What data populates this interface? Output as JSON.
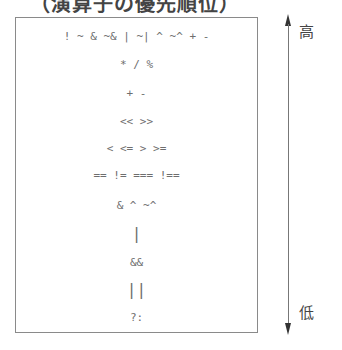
{
  "title": "（演算子の優先順位）",
  "precedence_rows": [
    "! ~ & ~& | ~| ^ ~^ + -",
    "* / %",
    "+ -",
    "<< >>",
    "< <= > >=",
    "== != === !==",
    "& ^ ~^",
    "|",
    "&&",
    "||",
    "?:"
  ],
  "axis": {
    "high_label": "高",
    "low_label": "低"
  },
  "colors": {
    "border": "#8a8a8a",
    "text": "#6e6e6e",
    "arrow": "#333333"
  }
}
